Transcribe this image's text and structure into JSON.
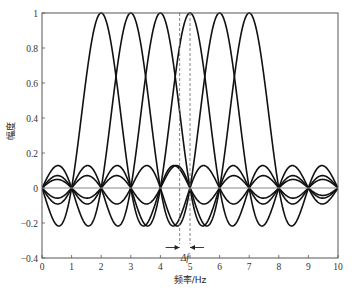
{
  "chart_data": {
    "type": "line",
    "title": "",
    "xlabel": "频率/Hz",
    "ylabel": "幅度",
    "xlim": [
      0,
      10
    ],
    "ylim": [
      -0.4,
      1
    ],
    "xticks": [
      0,
      1,
      2,
      3,
      4,
      5,
      6,
      7,
      8,
      9,
      10
    ],
    "xtick_labels": [
      "0",
      "1",
      "2",
      "3",
      "4",
      "5",
      "6",
      "7",
      "8",
      "9",
      "10"
    ],
    "yticks": [
      -0.4,
      -0.2,
      0,
      0.2,
      0.4,
      0.6,
      0.8,
      1
    ],
    "ytick_labels": [
      "-0.4",
      "-0.2",
      "0",
      "0.2",
      "0.4",
      "0.6",
      "0.8",
      "1"
    ],
    "grid": false,
    "legend": null,
    "function": "sinc: sin(pi*(f-fc))/(pi*(f-fc))",
    "series": [
      {
        "name": "subcarrier 1",
        "center": 2
      },
      {
        "name": "subcarrier 2",
        "center": 3
      },
      {
        "name": "subcarrier 3",
        "center": 4
      },
      {
        "name": "subcarrier 4",
        "center": 5
      },
      {
        "name": "subcarrier 5",
        "center": 6
      },
      {
        "name": "subcarrier 6",
        "center": 7
      }
    ],
    "annotations": [
      {
        "type": "dashed-vline",
        "x": 4.65
      },
      {
        "type": "dashed-vline",
        "x": 5.0
      },
      {
        "type": "double-arrow-inward",
        "x1": 4.65,
        "x2": 5.0,
        "label": "Δf"
      }
    ],
    "zero_line": true
  },
  "colors": {
    "curve": "#111111",
    "axis": "#555555",
    "zero_line": "#888888",
    "dashed": "#777777"
  }
}
